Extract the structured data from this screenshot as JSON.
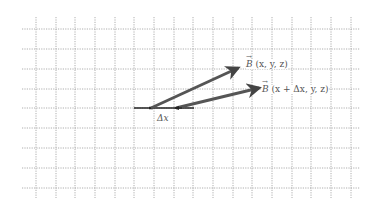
{
  "diagram": {
    "title": "",
    "grid": {
      "x_start": 22,
      "x_end": 360,
      "y_start": 17,
      "y_end": 198,
      "v_lines": [
        36,
        56,
        75,
        95,
        115,
        134,
        154,
        174,
        193,
        213,
        233,
        252,
        272,
        292,
        311,
        331,
        351
      ],
      "h_lines": [
        29,
        49,
        69,
        89,
        108,
        128,
        148,
        168,
        188
      ],
      "color": "#9a9a9a"
    },
    "baseline": {
      "x1": 134,
      "y1": 108,
      "x2": 194,
      "y2": 108,
      "color": "#222222"
    },
    "vectors": [
      {
        "name": "B(x,y,z)",
        "x1": 151,
        "y1": 108,
        "x2": 238,
        "y2": 68,
        "color": "#555555"
      },
      {
        "name": "B(x+Δx,y,z)",
        "x1": 176,
        "y1": 108,
        "x2": 259,
        "y2": 88,
        "color": "#555555"
      }
    ],
    "labels": {
      "b1": {
        "symbol": "B",
        "args": "(x, y, z)",
        "x": 246,
        "y": 60
      },
      "b2": {
        "symbol": "B",
        "args": "(x + Δx, y, z)",
        "x": 262,
        "y": 85
      },
      "dx": {
        "text": "Δx",
        "x": 157,
        "y": 114
      }
    }
  }
}
